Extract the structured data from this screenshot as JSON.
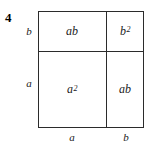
{
  "figure": {
    "problem_number": "4"
  },
  "cells": [
    {
      "id": "top-left",
      "base": "ab",
      "exponent": ""
    },
    {
      "id": "top-right",
      "base": "b",
      "exponent": "2"
    },
    {
      "id": "bottom-left",
      "base": "a",
      "exponent": "2"
    },
    {
      "id": "bottom-right",
      "base": "ab",
      "exponent": ""
    }
  ],
  "edges": {
    "left_top": "b",
    "left_bottom": "a",
    "bottom_left": "a",
    "bottom_right": "b"
  },
  "colors": {
    "line": "#2b2b2b",
    "text": "#1a1a1a",
    "background": "#ffffff"
  },
  "chart_data": {
    "type": "diagram",
    "title": "",
    "subtype": "area-model-square",
    "identity": "(a + b)^2 = a^2 + 2ab + b^2",
    "outer_square": {
      "x": 38,
      "y": 11,
      "width": 106,
      "height": 117
    },
    "divider_x": 106,
    "divider_y": 51,
    "regions": [
      {
        "position": "top-left",
        "label": "ab",
        "width_label": "a",
        "height_label": "b"
      },
      {
        "position": "top-right",
        "label": "b^2",
        "width_label": "b",
        "height_label": "b"
      },
      {
        "position": "bottom-left",
        "label": "a^2",
        "width_label": "a",
        "height_label": "a"
      },
      {
        "position": "bottom-right",
        "label": "ab",
        "width_label": "b",
        "height_label": "a"
      }
    ],
    "axis_labels": {
      "left": [
        "b",
        "a"
      ],
      "bottom": [
        "a",
        "b"
      ]
    },
    "grid": false,
    "legend": null
  }
}
